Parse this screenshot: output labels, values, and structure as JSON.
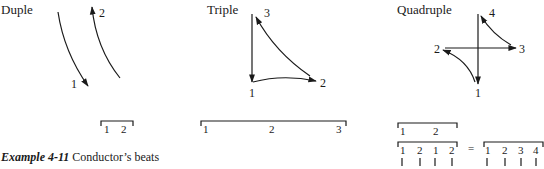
{
  "patterns": {
    "duple": {
      "title": "Duple",
      "beats": [
        "1",
        "2"
      ],
      "bracket": [
        "1",
        "2"
      ]
    },
    "triple": {
      "title": "Triple",
      "beats": [
        "1",
        "2",
        "3"
      ],
      "bracket": [
        "1",
        "2",
        "3"
      ]
    },
    "quadruple": {
      "title": "Quadruple",
      "beats": [
        "1",
        "2",
        "3",
        "4"
      ],
      "bracket_top": [
        "1",
        "2"
      ],
      "bracket_mid": [
        "1",
        "2",
        "1",
        "2"
      ],
      "equals": "=",
      "bracket_right": [
        "1",
        "2",
        "3",
        "4"
      ]
    }
  },
  "caption": {
    "label": "Example 4-11",
    "text": "Conductor’s beats"
  },
  "colors": {
    "ink": "#1a1a1a",
    "background": "#ffffff"
  }
}
